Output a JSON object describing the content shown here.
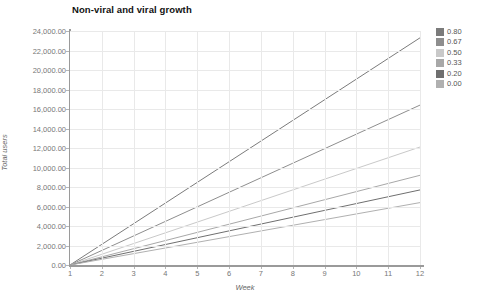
{
  "chart_data": {
    "type": "line",
    "title": "Non-viral and viral growth",
    "xlabel": "Week",
    "ylabel": "Total users",
    "xlim": [
      1,
      12
    ],
    "ylim": [
      0,
      24000
    ],
    "x": [
      1,
      2,
      3,
      4,
      5,
      6,
      7,
      8,
      9,
      10,
      11,
      12
    ],
    "xticks": [
      "1",
      "2",
      "3",
      "4",
      "5",
      "6",
      "7",
      "8",
      "9",
      "10",
      "11",
      "12"
    ],
    "yticks": [
      "24,000.00",
      "22,000.00",
      "20,000.00",
      "18,000.00",
      "16,000.00",
      "14,000.00",
      "12,000.00",
      "10,000.00",
      "8,000.00",
      "6,000.00",
      "4,000.00",
      "2,000.00",
      "0.00"
    ],
    "ytick_values": [
      24000,
      22000,
      20000,
      18000,
      16000,
      14000,
      12000,
      10000,
      8000,
      6000,
      4000,
      2000,
      0
    ],
    "grid": true,
    "legend_position": "right",
    "legend_title": "",
    "series": [
      {
        "name": "0.80",
        "color": "#7b7b7b",
        "values": [
          0,
          2118,
          4236,
          6355,
          8473,
          10591,
          12709,
          14827,
          16945,
          19064,
          21182,
          23300
        ]
      },
      {
        "name": "0.67",
        "color": "#8e8e8e",
        "values": [
          0,
          1491,
          2982,
          4473,
          5964,
          7455,
          8945,
          10436,
          11927,
          13418,
          14909,
          16400
        ]
      },
      {
        "name": "0.50",
        "color": "#c9c9c9",
        "values": [
          0,
          1100,
          2200,
          3300,
          4400,
          5500,
          6600,
          7700,
          8800,
          9900,
          11000,
          12100
        ]
      },
      {
        "name": "0.33",
        "color": "#a8a8a8",
        "values": [
          0,
          836,
          1673,
          2509,
          3345,
          4182,
          5018,
          5855,
          6691,
          7527,
          8364,
          9200
        ]
      },
      {
        "name": "0.20",
        "color": "#6f6f6f",
        "values": [
          0,
          700,
          1400,
          2100,
          2800,
          3500,
          4200,
          4900,
          5600,
          6300,
          7000,
          7700
        ]
      },
      {
        "name": "0.00",
        "color": "#b0b0b0",
        "values": [
          0,
          582,
          1164,
          1745,
          2327,
          2909,
          3491,
          4073,
          4655,
          5236,
          5818,
          6400
        ]
      }
    ]
  }
}
